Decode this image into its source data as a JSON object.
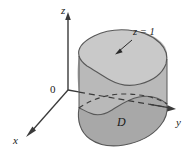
{
  "figure": {
    "type": "3d-solid-diagram",
    "background_color": "#ffffff",
    "axes": {
      "z_label": "z",
      "y_label": "y",
      "x_label": "x",
      "origin_label": "0"
    },
    "annotations": {
      "height_label": "z = 1",
      "region_label": "D"
    },
    "colors": {
      "top_face": "#c9c9c9",
      "side_face": "#b9b9b9",
      "base_face": "#a8a8a8",
      "outline": "#4a4a4a",
      "axis": "#3a3a3a",
      "text": "#1a1a1a"
    },
    "geometry": {
      "z_axis": {
        "x": 68,
        "y_top": 14,
        "y_bottom": 90,
        "arrow": "up"
      },
      "y_axis": {
        "x_start": 68,
        "y_start": 90,
        "x_end": 173,
        "y_end": 108,
        "arrow": "right",
        "hidden_segment": true
      },
      "x_axis": {
        "x_start": 68,
        "y_start": 90,
        "x_end": 26,
        "y_end": 137,
        "arrow": "down-left"
      },
      "solid_height_px": 56,
      "top_outline_center": [
        120,
        52
      ],
      "base_outline_center": [
        120,
        118
      ]
    }
  }
}
